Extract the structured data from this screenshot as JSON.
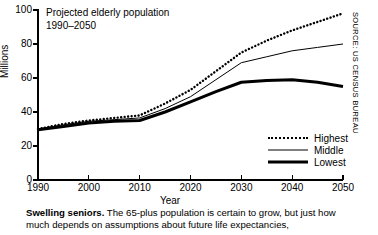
{
  "chart_data": {
    "type": "line",
    "title": "Projected elderly population\n1990–2050",
    "xlabel": "Year",
    "ylabel": "Millions",
    "xlim": [
      1990,
      2050
    ],
    "ylim": [
      0,
      100
    ],
    "xticks": [
      1990,
      2000,
      2010,
      2020,
      2030,
      2040,
      2050
    ],
    "yticks": [
      0,
      20,
      40,
      60,
      80,
      100
    ],
    "grid": false,
    "legend_position": "lower-right",
    "x": [
      1990,
      1995,
      2000,
      2005,
      2010,
      2015,
      2020,
      2025,
      2030,
      2035,
      2040,
      2045,
      2050
    ],
    "series": [
      {
        "name": "Highest",
        "style": "dotted",
        "values": [
          30,
          33,
          35,
          36.5,
          38,
          45,
          53,
          64,
          75,
          82,
          88,
          93,
          98
        ]
      },
      {
        "name": "Middle",
        "style": "thin-solid",
        "values": [
          30,
          32.5,
          34.5,
          35.5,
          36.5,
          42,
          49,
          59,
          69,
          72.5,
          76,
          78,
          80
        ]
      },
      {
        "name": "Lowest",
        "style": "thick-solid",
        "values": [
          29.5,
          31.5,
          33.5,
          34.5,
          35,
          40,
          46,
          52,
          57.5,
          58.5,
          59,
          57.5,
          55
        ]
      }
    ]
  },
  "source": {
    "text": "SOURCE: US CENSUS BUREAU"
  },
  "caption": {
    "lead": "Swelling seniors.",
    "body": " The 65-plus population is certain to grow, but just how much depends on assumptions about future life expectancies,"
  }
}
